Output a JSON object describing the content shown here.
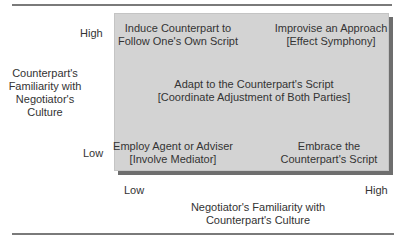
{
  "diagram": {
    "y_axis": {
      "label_lines": [
        "Counterpart's",
        "Familiarity with",
        "Negotiator's",
        "Culture"
      ],
      "high": "High",
      "low": "Low"
    },
    "x_axis": {
      "label_lines": [
        "Negotiator's Familiarity with",
        "Counterpart's Culture"
      ],
      "low": "Low",
      "high": "High"
    },
    "cells": {
      "top_left": [
        "Induce Counterpart to",
        "Follow One's Own Script"
      ],
      "top_right": [
        "Improvise an Approach",
        "[Effect Symphony]"
      ],
      "center": [
        "Adapt to the Counterpart's Script",
        "[Coordinate Adjustment of Both Parties]"
      ],
      "bottom_left": [
        "Employ Agent or Adviser",
        "[Involve Mediator]"
      ],
      "bottom_right": [
        "Embrace the",
        "Counterpart's Script"
      ]
    },
    "colors": {
      "box_fill": "#d3d3d3",
      "box_shadow": "#6e6e6e",
      "rule": "#7a7a7a",
      "text": "#333333"
    }
  }
}
